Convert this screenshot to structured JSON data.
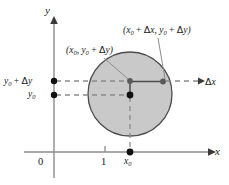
{
  "figure": {
    "background_color": "#ffffff",
    "disc": {
      "fill_color": "#c9c9c9",
      "stroke_color": "#4d4d4d",
      "center_x": 130,
      "center_y": 94,
      "radius": 42
    },
    "axes": {
      "x_axis_label": "x",
      "y_axis_label": "y",
      "origin_label": "0",
      "x_tick_labels": [
        "1"
      ],
      "axis_color": "#8c8c8c",
      "x_axis_y": 152,
      "y_axis_x": 54
    },
    "labels": {
      "point_top_right": "(x0 + Δx, y0 + Δy)",
      "point_left": "(x0, y0 + Δy)",
      "y_upper": "y0 + Δy",
      "y_lower": "y0",
      "delta_x_arrow": "Δx",
      "x_sub_zero": "x0"
    },
    "points": [
      {
        "name": "center-point",
        "label": "(x0, y0)",
        "x": 130,
        "y": 95,
        "style": "filled-black"
      },
      {
        "name": "vertical-increment-point",
        "label": "(x0, y0 + Δy)",
        "x": 130,
        "y": 81,
        "style": "filled-gray"
      },
      {
        "name": "corner-point",
        "label": "(x0 + Δx, y0 + Δy)",
        "x": 163,
        "y": 82,
        "style": "filled-gray"
      },
      {
        "name": "y-axis-upper-dot",
        "label": "y0 + Δy",
        "x": 54,
        "y": 81,
        "style": "filled-black"
      },
      {
        "name": "y-axis-lower-dot",
        "label": "y0",
        "x": 54,
        "y": 95,
        "style": "filled-black"
      },
      {
        "name": "x-axis-dot",
        "label": "x0",
        "x": 130,
        "y": 152,
        "style": "filled-black"
      }
    ],
    "colors": {
      "dash_color": "#8c8c8c",
      "text_color": "#1a1a1a",
      "leader_color": "#8c8c8c"
    }
  }
}
